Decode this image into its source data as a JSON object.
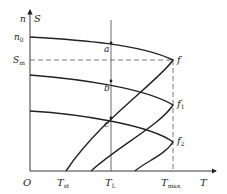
{
  "diagram": {
    "type": "motor speed-torque characteristic curves",
    "axes": {
      "y_label_1": "n",
      "y_label_2": "S",
      "x_label": "T",
      "origin": "O"
    },
    "y_ticks": {
      "n0": {
        "main": "n",
        "sub": "0"
      },
      "Sm": {
        "main": "S",
        "sub": "m"
      }
    },
    "x_ticks": {
      "Tst": {
        "main": "T",
        "sub": "st"
      },
      "TL": {
        "main": "T",
        "sub": "L"
      },
      "Tmax": {
        "main": "T",
        "sub": "max"
      }
    },
    "points": {
      "a": "a",
      "b": "b",
      "c": "c",
      "f": "f",
      "f1": {
        "main": "f",
        "sub": "1"
      },
      "f2": {
        "main": "f",
        "sub": "2"
      }
    },
    "curves": [
      {
        "name": "curve-1",
        "start_y_label": "n0",
        "peak_label": "f"
      },
      {
        "name": "curve-2",
        "peak_label": "f1"
      },
      {
        "name": "curve-3",
        "peak_label": "f2"
      }
    ],
    "colors": {
      "line": "#222222",
      "dashed": "#444444",
      "background": "#ffffff"
    }
  }
}
